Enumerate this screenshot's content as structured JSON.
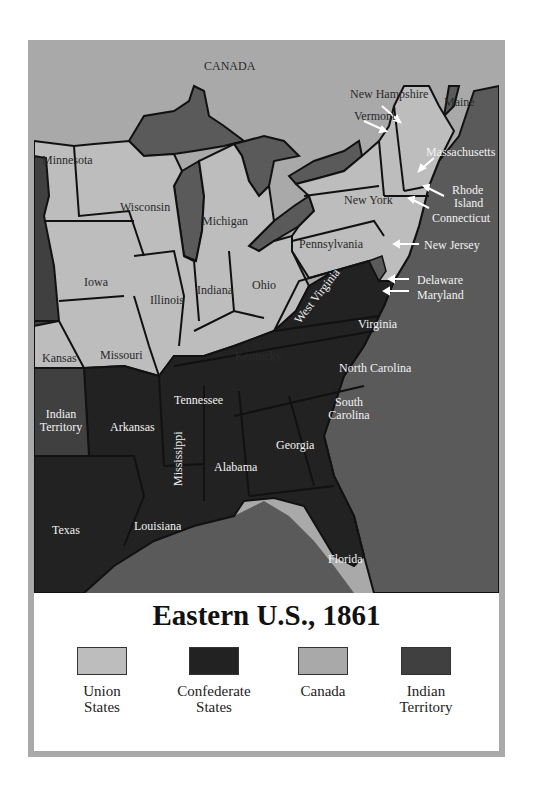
{
  "map": {
    "colors": {
      "union": "#bdbdbd",
      "confederate": "#222222",
      "canada": "#a9a9a9",
      "indian_territory": "#404040",
      "water": "#5a5a5a",
      "frame": "#a9a9a9"
    },
    "labels": {
      "canada": "CANADA",
      "minnesota": "Minnesota",
      "wisconsin": "Wisconsin",
      "michigan": "Michigan",
      "iowa": "Iowa",
      "illinois": "Illinois",
      "indiana": "Indiana",
      "ohio": "Ohio",
      "kansas": "Kansas",
      "missouri": "Missouri",
      "kentucky": "Kentucky",
      "new_york": "New York",
      "pennsylvania": "Pennsylvania",
      "new_hampshire": "New Hampshire",
      "vermont": "Vermont",
      "maine": "Maine",
      "massachusetts": "Massachusetts",
      "rhode_island_1": "Rhode",
      "rhode_island_2": "Island",
      "connecticut": "Connecticut",
      "new_jersey": "New Jersey",
      "delaware": "Delaware",
      "maryland": "Maryland",
      "west_virginia": "West Virginia",
      "virginia": "Virginia",
      "north_carolina": "North Carolina",
      "south_carolina_1": "South",
      "south_carolina_2": "Carolina",
      "tennessee": "Tennessee",
      "indian_territory_1": "Indian",
      "indian_territory_2": "Territory",
      "arkansas": "Arkansas",
      "mississippi": "Mississippi",
      "alabama": "Alabama",
      "georgia": "Georgia",
      "texas": "Texas",
      "louisiana": "Louisiana",
      "florida": "Florida"
    }
  },
  "title": "Eastern U.S., 1861",
  "legend": [
    {
      "line1": "Union",
      "line2": "States",
      "color": "#bdbdbd"
    },
    {
      "line1": "Confederate",
      "line2": "States",
      "color": "#222222"
    },
    {
      "line1": "Canada",
      "line2": "",
      "color": "#a9a9a9"
    },
    {
      "line1": "Indian",
      "line2": "Territory",
      "color": "#404040"
    }
  ]
}
